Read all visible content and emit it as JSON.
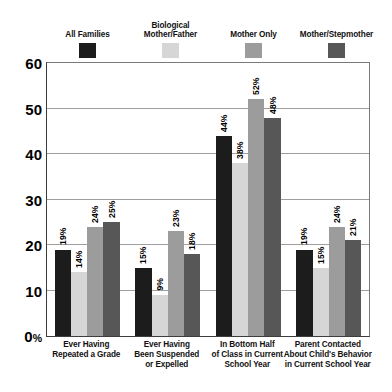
{
  "chart_data": {
    "type": "bar",
    "title": "",
    "xlabel": "",
    "ylabel": "",
    "ylim": [
      0,
      60
    ],
    "yticks": [
      0,
      10,
      20,
      30,
      40,
      50,
      60
    ],
    "ytick_labels": [
      "0%",
      "10",
      "20",
      "30",
      "40",
      "50",
      "60"
    ],
    "grid": true,
    "legend_position": "top",
    "value_suffix": "%",
    "categories": [
      "Ever Having\nRepeated a Grade",
      "Ever Having\nBeen Suspended\nor Expelled",
      "In Bottom Half\nof Class in Current\nSchool Year",
      "Parent Contacted\nAbout Child's Behavior\nin Current School Year"
    ],
    "series": [
      {
        "name": "All Families",
        "color": "#1c1c1c",
        "values": [
          19,
          15,
          44,
          19
        ],
        "labels": [
          "19%",
          "15%",
          "44%",
          "19%"
        ]
      },
      {
        "name": "Biological\nMother/Father",
        "color": "#d6d6d6",
        "values": [
          14,
          9,
          38,
          15
        ],
        "labels": [
          "14%",
          "9%",
          "38%",
          "15%"
        ]
      },
      {
        "name": "Mother Only",
        "color": "#9c9c9c",
        "values": [
          24,
          23,
          52,
          24
        ],
        "labels": [
          "24%",
          "23%",
          "52%",
          "24%"
        ]
      },
      {
        "name": "Mother/Stepmother",
        "color": "#575757",
        "values": [
          25,
          18,
          48,
          21
        ],
        "labels": [
          "25%",
          "18%",
          "48%",
          "21%"
        ]
      }
    ]
  },
  "legend": {
    "items": [
      {
        "label": "All Families",
        "color": "#1c1c1c"
      },
      {
        "label": "Biological\nMother/Father",
        "color": "#d6d6d6"
      },
      {
        "label": "Mother Only",
        "color": "#9c9c9c"
      },
      {
        "label": "Mother/Stepmother",
        "color": "#575757"
      }
    ]
  }
}
